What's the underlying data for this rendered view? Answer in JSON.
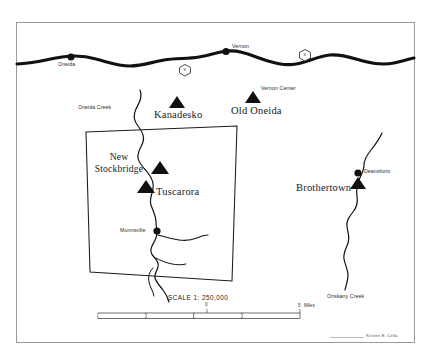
{
  "map": {
    "title_note": "Historic Oneida-area settlement map",
    "scale_text": "SCALE 1: 250,000",
    "credit": "Kristen E. Cella",
    "background_color": "#ffffff",
    "ink_color": "#111111",
    "frame": {
      "outer_x": 16,
      "outer_y": 22,
      "outer_w": 399,
      "outer_h": 321
    },
    "scale_bar": {
      "zero_label": "0",
      "end_label": "5",
      "units_label": "Miles",
      "segments": 4
    },
    "highway_shields": [
      {
        "id": "shield-west",
        "number": "5",
        "x": 185,
        "y": 70
      },
      {
        "id": "shield-east",
        "number": "5",
        "x": 305,
        "y": 55
      }
    ],
    "modern_towns": [
      {
        "name": "Oneida",
        "label": "Oneida",
        "x": 71,
        "y": 57,
        "label_x": 60,
        "label_y": 64
      },
      {
        "name": "Vernon",
        "label": "Vernon",
        "x": 226,
        "y": 52,
        "label_x": 233,
        "label_y": 47
      },
      {
        "name": "Munnsville",
        "label": "Munnsville",
        "x": 157,
        "y": 231,
        "label_x": 123,
        "label_y": 228
      },
      {
        "name": "Deansboro",
        "label": "Deansboro",
        "x": 358,
        "y": 173,
        "label_x": 365,
        "label_y": 170
      },
      {
        "name": "Vernon Center",
        "label": "Vernon Center",
        "x": 253,
        "y": 94,
        "label_x": 262,
        "label_y": 89
      }
    ],
    "historic_villages": [
      {
        "name": "Kanadesko",
        "label": "Kanadesko",
        "triangle_x": 177,
        "triangle_y": 99,
        "label_x": 155,
        "label_y": 111
      },
      {
        "name": "Old Oneida",
        "label": "Old Oneida",
        "triangle_x": 253,
        "triangle_y": 94,
        "label_x": 232,
        "label_y": 107
      },
      {
        "name": "Tuscarora",
        "label": "Tuscarora",
        "triangle_x": 146,
        "triangle_y": 185,
        "label_x": 155,
        "label_y": 188
      },
      {
        "name": "New Stockbridge",
        "label": "New\nStockbridge",
        "triangle_x": 160,
        "triangle_y": 166,
        "label_x": 88,
        "label_y": 152
      },
      {
        "name": "Brothertown",
        "label": "Brothertown",
        "triangle_x": 358,
        "triangle_y": 182,
        "label_x": 297,
        "label_y": 184
      }
    ],
    "waterways": [
      {
        "name": "Oneida Creek",
        "label": "Oneida Creek",
        "label_x": 79,
        "label_y": 108
      },
      {
        "name": "Oriskany Creek",
        "label": "Oriskany Creek",
        "label_x": 330,
        "label_y": 297
      }
    ],
    "reservation_box": {
      "name": "Oneida Reservation boundary",
      "points": "86,132 237,126 232,281 90,272"
    }
  }
}
